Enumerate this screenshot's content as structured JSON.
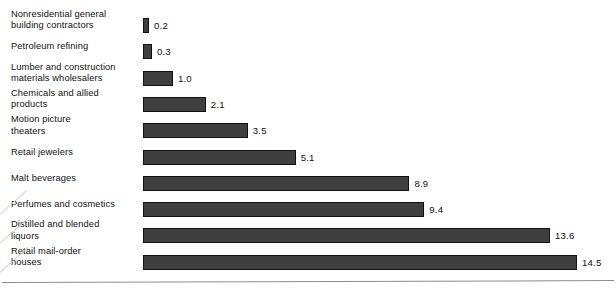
{
  "chart_data": {
    "type": "bar",
    "orientation": "horizontal",
    "title": "",
    "subtitle": "",
    "xlabel": "",
    "ylabel": "",
    "grid": false,
    "legend": null,
    "xlim": [
      0,
      15.8
    ],
    "axis_rule_visible": true,
    "value_label_position": "outside-end",
    "bar_color": "#3f3f3f",
    "bar_border_color": "#121212",
    "background_color": "#ffffff",
    "text_color": "#111111",
    "categories": [
      "Nonresidential general building contractors",
      "Petroleum refining",
      "Lumber and construction materials wholesalers",
      "Chemicals and allied products",
      "Motion picture theaters",
      "Retail jewelers",
      "Malt beverages",
      "Perfumes and cosmetics",
      "Distilled and blended liquors",
      "Retail mail-order houses"
    ],
    "values": [
      0.2,
      0.3,
      1.0,
      2.1,
      3.5,
      5.1,
      8.9,
      9.4,
      13.6,
      14.5
    ],
    "value_labels": [
      "0.2",
      "0.3",
      "1.0",
      "2.1",
      "3.5",
      "5.1",
      "8.9",
      "9.4",
      "13.6",
      "14.5"
    ],
    "bars": [
      {
        "label": "Nonresidential general\nbuilding contractors",
        "lines": 2,
        "value": 0.2,
        "value_label": "0.2"
      },
      {
        "label": "Petroleum refining",
        "lines": 1,
        "value": 0.3,
        "value_label": "0.3"
      },
      {
        "label": "Lumber and construction\nmaterials wholesalers",
        "lines": 2,
        "value": 1.0,
        "value_label": "1.0"
      },
      {
        "label": "Chemicals and allied\nproducts",
        "lines": 2,
        "value": 2.1,
        "value_label": "2.1"
      },
      {
        "label": "Motion picture\ntheaters",
        "lines": 2,
        "value": 3.5,
        "value_label": "3.5"
      },
      {
        "label": "Retail jewelers",
        "lines": 1,
        "value": 5.1,
        "value_label": "5.1"
      },
      {
        "label": "Malt beverages",
        "lines": 1,
        "value": 8.9,
        "value_label": "8.9"
      },
      {
        "label": "Perfumes and cosmetics",
        "lines": 1,
        "value": 9.4,
        "value_label": "9.4"
      },
      {
        "label": "Distilled and blended\nliquors",
        "lines": 2,
        "value": 13.6,
        "value_label": "13.6"
      },
      {
        "label": "Retail mail-order\nhouses",
        "lines": 2,
        "value": 14.5,
        "value_label": "14.5"
      }
    ]
  }
}
